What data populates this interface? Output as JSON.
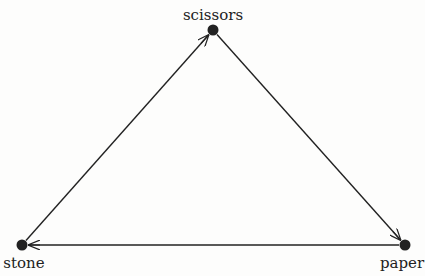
{
  "diagram": {
    "type": "directed-cycle",
    "line_color": "#222222",
    "nodes": [
      {
        "id": "scissors",
        "label": "scissors",
        "x": 213,
        "y": 30,
        "label_x": 213,
        "label_y": 6
      },
      {
        "id": "stone",
        "label": "stone",
        "x": 22,
        "y": 245,
        "label_x": 24,
        "label_y": 254
      },
      {
        "id": "paper",
        "label": "paper",
        "x": 405,
        "y": 245,
        "label_x": 402,
        "label_y": 254
      }
    ],
    "edges": [
      {
        "from": "stone",
        "to": "scissors"
      },
      {
        "from": "scissors",
        "to": "paper"
      },
      {
        "from": "paper",
        "to": "stone"
      }
    ]
  }
}
